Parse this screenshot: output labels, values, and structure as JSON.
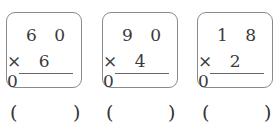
{
  "problems": [
    {
      "top": "6 0",
      "bottom": "× 6 0",
      "answer": ""
    },
    {
      "top": "9 0",
      "bottom": "× 4 0",
      "answer": ""
    },
    {
      "top": "1 8",
      "bottom": "× 2 0",
      "answer": ""
    }
  ],
  "paren_open": "(",
  "paren_close": ")"
}
